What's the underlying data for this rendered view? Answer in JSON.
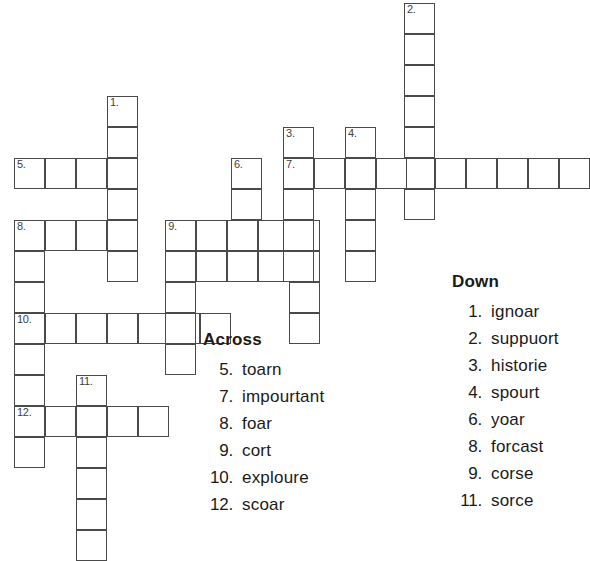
{
  "puzzle": {
    "cell_size": 31,
    "origin_x": 14,
    "origin_y": 3,
    "grid_line_color": "#4a4a4a",
    "cell_fill": "#ffffff",
    "cells": [
      {
        "col": 3,
        "row": 3,
        "num": "1."
      },
      {
        "col": 3,
        "row": 4,
        "num": ""
      },
      {
        "col": 3,
        "row": 5,
        "num": ""
      },
      {
        "col": 3,
        "row": 6,
        "num": ""
      },
      {
        "col": 3,
        "row": 7,
        "num": ""
      },
      {
        "col": 3,
        "row": 8,
        "num": ""
      },
      {
        "col": 0,
        "row": 5,
        "num": "5."
      },
      {
        "col": 1,
        "row": 5,
        "num": ""
      },
      {
        "col": 2,
        "row": 5,
        "num": ""
      },
      {
        "col": 0,
        "row": 7,
        "num": "8."
      },
      {
        "col": 1,
        "row": 7,
        "num": ""
      },
      {
        "col": 2,
        "row": 7,
        "num": ""
      },
      {
        "col": 0,
        "row": 8,
        "num": ""
      },
      {
        "col": 0,
        "row": 9,
        "num": ""
      },
      {
        "col": 0,
        "row": 10,
        "num": "10."
      },
      {
        "col": 1,
        "row": 10,
        "num": ""
      },
      {
        "col": 2,
        "row": 10,
        "num": ""
      },
      {
        "col": 3,
        "row": 10,
        "num": ""
      },
      {
        "col": 4,
        "row": 10,
        "num": ""
      },
      {
        "col": 5,
        "row": 10,
        "num": ""
      },
      {
        "col": 6,
        "row": 10,
        "num": ""
      },
      {
        "col": 0,
        "row": 11,
        "num": ""
      },
      {
        "col": 0,
        "row": 12,
        "num": ""
      },
      {
        "col": 0,
        "row": 13,
        "num": "12."
      },
      {
        "col": 1,
        "row": 13,
        "num": ""
      },
      {
        "col": 2,
        "row": 13,
        "num": ""
      },
      {
        "col": 3,
        "row": 13,
        "num": ""
      },
      {
        "col": 4,
        "row": 13,
        "num": ""
      },
      {
        "col": 0,
        "row": 14,
        "num": ""
      },
      {
        "col": 2,
        "row": 12,
        "num": "11."
      },
      {
        "col": 2,
        "row": 14,
        "num": ""
      },
      {
        "col": 2,
        "row": 15,
        "num": ""
      },
      {
        "col": 2,
        "row": 16,
        "num": ""
      },
      {
        "col": 2,
        "row": 17,
        "num": ""
      },
      {
        "col": 7,
        "row": 5,
        "num": "6."
      },
      {
        "col": 7,
        "row": 6,
        "num": ""
      },
      {
        "col": 4.88,
        "row": 7,
        "num": "9."
      },
      {
        "col": 5.88,
        "row": 7,
        "num": ""
      },
      {
        "col": 6.88,
        "row": 7,
        "num": ""
      },
      {
        "col": 7.88,
        "row": 7,
        "num": ""
      },
      {
        "col": 8.88,
        "row": 7,
        "num": ""
      },
      {
        "col": 4.88,
        "row": 8,
        "num": ""
      },
      {
        "col": 5.88,
        "row": 8,
        "num": ""
      },
      {
        "col": 6.88,
        "row": 8,
        "num": ""
      },
      {
        "col": 7.88,
        "row": 8,
        "num": ""
      },
      {
        "col": 8.88,
        "row": 8,
        "num": ""
      },
      {
        "col": 4.88,
        "row": 9,
        "num": ""
      },
      {
        "col": 4.88,
        "row": 10,
        "num": ""
      },
      {
        "col": 4.88,
        "row": 11,
        "num": ""
      },
      {
        "col": 8.88,
        "row": 9,
        "num": ""
      },
      {
        "col": 8.88,
        "row": 10,
        "num": ""
      },
      {
        "col": 8.68,
        "row": 4,
        "num": "3."
      },
      {
        "col": 8.68,
        "row": 5,
        "num": "7."
      },
      {
        "col": 8.68,
        "row": 6,
        "num": ""
      },
      {
        "col": 8.68,
        "row": 7,
        "num": ""
      },
      {
        "col": 8.68,
        "row": 8,
        "num": ""
      },
      {
        "col": 10.68,
        "row": 4,
        "num": "4."
      },
      {
        "col": 10.68,
        "row": 5,
        "num": ""
      },
      {
        "col": 10.68,
        "row": 6,
        "num": ""
      },
      {
        "col": 10.68,
        "row": 7,
        "num": ""
      },
      {
        "col": 10.68,
        "row": 8,
        "num": ""
      },
      {
        "col": 12.58,
        "row": 0,
        "num": "2."
      },
      {
        "col": 12.58,
        "row": 1,
        "num": ""
      },
      {
        "col": 12.58,
        "row": 2,
        "num": ""
      },
      {
        "col": 12.58,
        "row": 3,
        "num": ""
      },
      {
        "col": 12.58,
        "row": 4,
        "num": ""
      },
      {
        "col": 12.58,
        "row": 5,
        "num": ""
      },
      {
        "col": 12.58,
        "row": 6,
        "num": ""
      },
      {
        "col": 9.68,
        "row": 5,
        "num": ""
      },
      {
        "col": 11.68,
        "row": 5,
        "num": ""
      },
      {
        "col": 13.58,
        "row": 5,
        "num": ""
      },
      {
        "col": 14.58,
        "row": 5,
        "num": ""
      },
      {
        "col": 15.58,
        "row": 5,
        "num": ""
      },
      {
        "col": 16.58,
        "row": 5,
        "num": ""
      },
      {
        "col": 17.58,
        "row": 5,
        "num": ""
      }
    ]
  },
  "across": {
    "heading": "Across",
    "clues": [
      {
        "num": "5.",
        "word": "toarn"
      },
      {
        "num": "7.",
        "word": "impourtant"
      },
      {
        "num": "8.",
        "word": "foar"
      },
      {
        "num": "9.",
        "word": "cort"
      },
      {
        "num": "10.",
        "word": "exploure"
      },
      {
        "num": "12.",
        "word": "scoar"
      }
    ]
  },
  "down": {
    "heading": "Down",
    "clues": [
      {
        "num": "1.",
        "word": "ignoar"
      },
      {
        "num": "2.",
        "word": "suppuort"
      },
      {
        "num": "3.",
        "word": "historie"
      },
      {
        "num": "4.",
        "word": "spourt"
      },
      {
        "num": "6.",
        "word": "yoar"
      },
      {
        "num": "8.",
        "word": "forcast"
      },
      {
        "num": "9.",
        "word": "corse"
      },
      {
        "num": "11.",
        "word": "sorce"
      }
    ]
  }
}
